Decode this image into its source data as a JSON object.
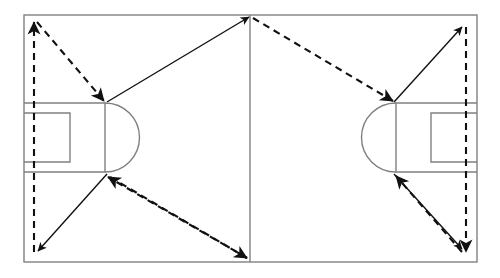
{
  "diagram": {
    "canvas": {
      "width": 500,
      "height": 278,
      "background": "#ffffff"
    },
    "colors": {
      "pitch_line": "#808080",
      "arrow_solid": "#111111",
      "arrow_dashed": "#111111",
      "background": "#ffffff"
    },
    "pitch": {
      "name": "football-pitch",
      "left": 24,
      "right": 477,
      "top": 15,
      "bottom": 262,
      "line_width": 1.4,
      "halfway_line_x": 250,
      "left_penalty_area": {
        "name": "left-penalty-area",
        "x": 24,
        "y_top": 103,
        "y_bottom": 172,
        "x_right": 105
      },
      "left_penalty_arc": {
        "name": "left-penalty-arc",
        "cx": 105,
        "cy": 137.5,
        "r": 34.5,
        "side": "right"
      },
      "left_goal_area": {
        "name": "left-goal-area",
        "x": 24,
        "y_top": 113,
        "y_bottom": 162,
        "x_right": 70
      },
      "right_penalty_area": {
        "name": "right-penalty-area",
        "x": 477,
        "y_top": 103,
        "y_bottom": 172,
        "x_left": 396
      },
      "right_penalty_arc": {
        "name": "right-penalty-arc",
        "cx": 396,
        "cy": 137.5,
        "r": 34.5,
        "side": "left"
      },
      "right_goal_area": {
        "name": "right-goal-area",
        "x": 477,
        "y_top": 113,
        "y_bottom": 162,
        "x_left": 431
      }
    },
    "solid_arrows": [
      {
        "name": "arrow-left-box-top-to-center-top",
        "x1": 107,
        "y1": 102,
        "x2": 249,
        "y2": 17,
        "label": "left penalty box top corner to halfway line top"
      },
      {
        "name": "arrow-left-box-bottom-to-bottom-left",
        "x1": 107,
        "y1": 174,
        "x2": 38,
        "y2": 251,
        "label": "left penalty box bottom corner to bottom left touchline"
      },
      {
        "name": "arrow-right-box-top-to-top-right",
        "x1": 394,
        "y1": 102,
        "x2": 462,
        "y2": 27,
        "label": "right penalty box top corner to top right touchline"
      },
      {
        "name": "arrow-right-box-bottom-to-bottom-right",
        "x1": 394,
        "y1": 174,
        "x2": 462,
        "y2": 249,
        "label": "right penalty box bottom corner to bottom right touchline"
      }
    ],
    "dashed_arrows": [
      {
        "name": "dashed-arrow-left-touchline-up",
        "x1": 34,
        "y1": 252,
        "x2": 34,
        "y2": 22,
        "label": "run up the left touchline"
      },
      {
        "name": "dashed-arrow-top-left-to-left-box-top",
        "x1": 37,
        "y1": 22,
        "x2": 104,
        "y2": 101,
        "label": "diagonal into left penalty box top corner"
      },
      {
        "name": "dashed-arrow-center-top-to-right-box-top",
        "x1": 253,
        "y1": 18,
        "x2": 393,
        "y2": 101,
        "label": "halfway line top to right penalty box top corner"
      },
      {
        "name": "dashed-arrow-right-touchline-down",
        "x1": 466,
        "y1": 27,
        "x2": 466,
        "y2": 252,
        "label": "run down the right touchline"
      },
      {
        "name": "dashed-arrow-bottom-right-to-right-box-bottom",
        "x1": 462,
        "y1": 252,
        "x2": 396,
        "y2": 176,
        "label": "diagonal into right penalty box bottom corner"
      },
      {
        "name": "dashed-arrow-center-bottom-to-left-box-bottom",
        "x1": 247,
        "y1": 258,
        "x2": 108,
        "y2": 177,
        "label": "halfway line bottom to left penalty box bottom corner"
      },
      {
        "name": "dashed-arrow-bottom-left-to-center-bottom",
        "x1": 110,
        "y1": 177,
        "x2": 247,
        "y2": 258,
        "label": "left penalty box bottom corner to halfway line bottom"
      }
    ],
    "dash_pattern": "7 5",
    "arrowhead": {
      "length": 13,
      "half_width": 5
    }
  }
}
